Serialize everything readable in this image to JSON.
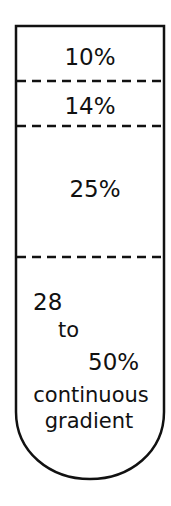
{
  "diagram": {
    "colors": {
      "stroke": "#111111",
      "background": "#ffffff"
    },
    "layers": [
      {
        "label": "10%"
      },
      {
        "label": "14%"
      },
      {
        "label": "25%"
      },
      {
        "label_lines": [
          "28",
          "to",
          "50%",
          "continuous",
          "gradient"
        ]
      }
    ]
  }
}
